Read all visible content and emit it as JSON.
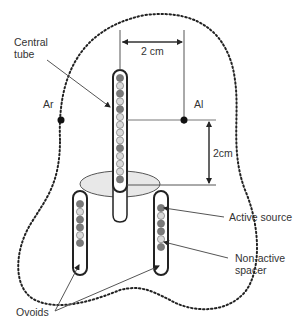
{
  "figure": {
    "labels": {
      "central_tube": [
        "Central",
        "tube"
      ],
      "ar": "Ar",
      "al": "Al",
      "width_dim": "2 cm",
      "height_dim": "2cm",
      "active_source": "Active source",
      "non_active_spacer": [
        "Non-active",
        "spacer"
      ],
      "ovoids": "Ovoids"
    },
    "central_tube_sequence": [
      "active",
      "spacer",
      "active",
      "spacer",
      "active",
      "spacer",
      "spacer",
      "spacer",
      "spacer",
      "active",
      "spacer",
      "spacer",
      "spacer",
      "active"
    ],
    "left_ovoid_sequence": [
      "active",
      "spacer",
      "active",
      "active",
      "spacer",
      "active"
    ],
    "right_ovoid_sequence": [
      "active",
      "spacer",
      "active",
      "active",
      "spacer",
      "active"
    ],
    "colors": {
      "active": "#7a7a7a",
      "spacer": "#d9d9d9",
      "flange": "#e8e8e8",
      "outline": "#222222",
      "line": "#555555"
    }
  }
}
